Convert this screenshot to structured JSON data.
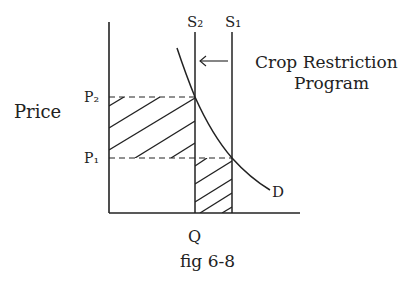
{
  "diagram": {
    "title": "Crop Restriction Program",
    "title_line1": "Crop Restriction",
    "title_line2": "Program",
    "caption": "fig 6-8",
    "y_axis_label": "Price",
    "x_axis_label": "Q",
    "price_labels": {
      "p1": "P₁",
      "p2": "P₂"
    },
    "supply_labels": {
      "s1": "S₁",
      "s2": "S₂"
    },
    "demand_label": "D",
    "arrow": "supply shifts left from S₁ to S₂",
    "colors": {
      "ink": "#222222",
      "background": "#ffffff"
    }
  }
}
